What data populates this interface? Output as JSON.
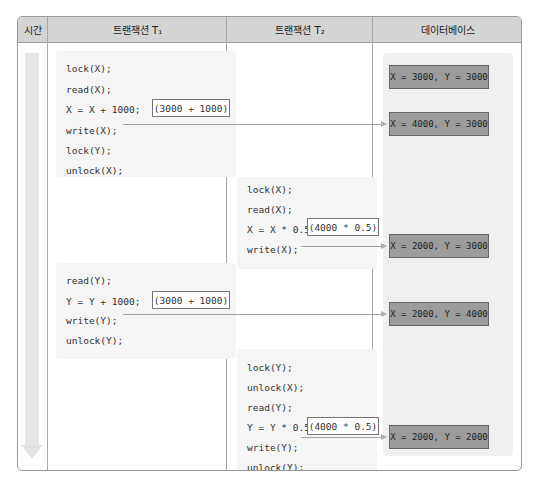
{
  "headers": {
    "time": "시간",
    "t1": "트랜잭션 T₁",
    "t2": "트랜잭션 T₂",
    "db": "데이터베이스"
  },
  "t1_block1": {
    "lines": [
      "lock(X);",
      "read(X);",
      "X = X + 1000;",
      "write(X);",
      "lock(Y);",
      "unlock(X);"
    ],
    "calc": "(3000 + 1000)"
  },
  "t2_block1": {
    "lines": [
      "lock(X);",
      "read(X);",
      "X = X * 0.5;",
      "write(X);"
    ],
    "calc": "(4000 * 0.5)"
  },
  "t1_block2": {
    "lines": [
      "read(Y);",
      "Y = Y + 1000;",
      "write(Y);",
      "unlock(Y);"
    ],
    "calc": "(3000 + 1000)"
  },
  "t2_block2": {
    "lines": [
      "lock(Y);",
      "unlock(X);",
      "read(Y);",
      "Y = Y * 0.5;",
      "write(Y);",
      "unlock(Y);"
    ],
    "calc": "(4000 * 0.5)"
  },
  "database_states": [
    "X = 3000, Y = 3000",
    "X = 4000, Y = 3000",
    "X = 2000, Y = 3000",
    "X = 2000, Y = 4000",
    "X = 2000, Y = 2000"
  ]
}
